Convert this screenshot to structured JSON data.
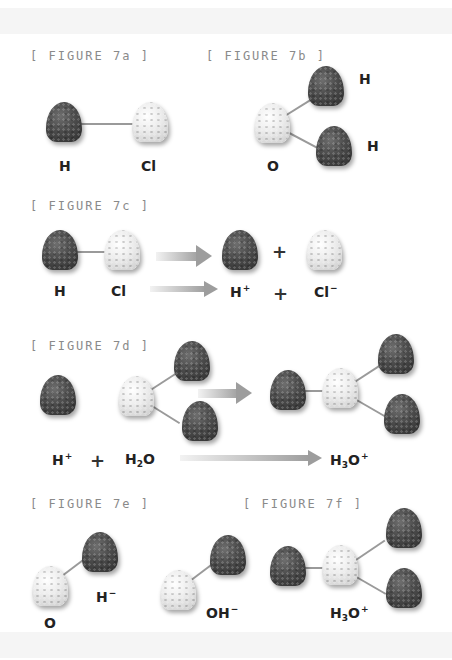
{
  "figures": {
    "f7a": {
      "title": "[ FIGURE 7a ]",
      "labels": {
        "h": "H",
        "cl": "Cl"
      }
    },
    "f7b": {
      "title": "[ FIGURE 7b ]",
      "labels": {
        "o": "O",
        "h1": "H",
        "h2": "H"
      }
    },
    "f7c": {
      "title": "[ FIGURE 7c ]",
      "labels": {
        "h": "H",
        "cl": "Cl",
        "plus": "+",
        "h_ion": "H",
        "h_ion_charge": "+",
        "plus2": "+",
        "cl_ion": "Cl",
        "cl_ion_charge": "−"
      }
    },
    "f7d": {
      "title": "[ FIGURE 7d ]",
      "labels": {
        "h_ion": "H",
        "h_ion_charge": "+",
        "plus": "+",
        "water_h": "H",
        "water_sub": "2",
        "water_o": "O",
        "hydronium_h": "H",
        "hydronium_sub": "3",
        "hydronium_o": "O",
        "hydronium_charge": "+"
      }
    },
    "f7e": {
      "title": "[ FIGURE 7e ]",
      "labels": {
        "o": "O",
        "h_ion": "H",
        "h_ion_charge": "−",
        "oh": "OH",
        "oh_charge": "−"
      }
    },
    "f7f": {
      "title": "[ FIGURE 7f ]",
      "labels": {
        "hydronium_h": "H",
        "hydronium_sub": "3",
        "hydronium_o": "O",
        "hydronium_charge": "+"
      }
    }
  },
  "colors": {
    "hydrogen": "#444444",
    "heavy_atom": "#e6e6e6",
    "bond": "#9a9a9a",
    "arrow": "#9d9d9d",
    "figure_label": "#8a8a8a"
  }
}
